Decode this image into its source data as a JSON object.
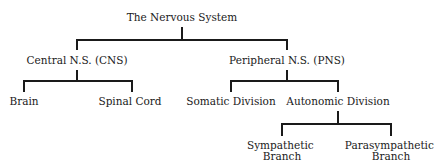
{
  "diagram": {
    "type": "tree",
    "root": {
      "label": "The Nervous System",
      "children": [
        "Central N.S. (CNS)",
        "Peripheral N.S. (PNS)"
      ]
    },
    "nodes": {
      "root": {
        "label": "The Nervous System"
      },
      "cns": {
        "label": "Central N.S. (CNS)"
      },
      "pns": {
        "label": "Peripheral N.S. (PNS)"
      },
      "brain": {
        "label": "Brain"
      },
      "spinal_cord": {
        "label": "Spinal Cord"
      },
      "somatic": {
        "label": "Somatic Division"
      },
      "autonomic": {
        "label": "Autonomic Division"
      },
      "sympathetic": {
        "line1": "Sympathetic",
        "line2": "Branch"
      },
      "parasympathetic": {
        "line1": "Parasympathetic",
        "line2": "Branch"
      }
    },
    "edges": [
      [
        "root",
        "cns"
      ],
      [
        "root",
        "pns"
      ],
      [
        "cns",
        "brain"
      ],
      [
        "cns",
        "spinal_cord"
      ],
      [
        "pns",
        "somatic"
      ],
      [
        "pns",
        "autonomic"
      ],
      [
        "autonomic",
        "sympathetic"
      ],
      [
        "autonomic",
        "parasympathetic"
      ]
    ],
    "colors": {
      "line": "#1a1a1a",
      "text": "#1a1a1a",
      "background": "#ffffff"
    }
  }
}
